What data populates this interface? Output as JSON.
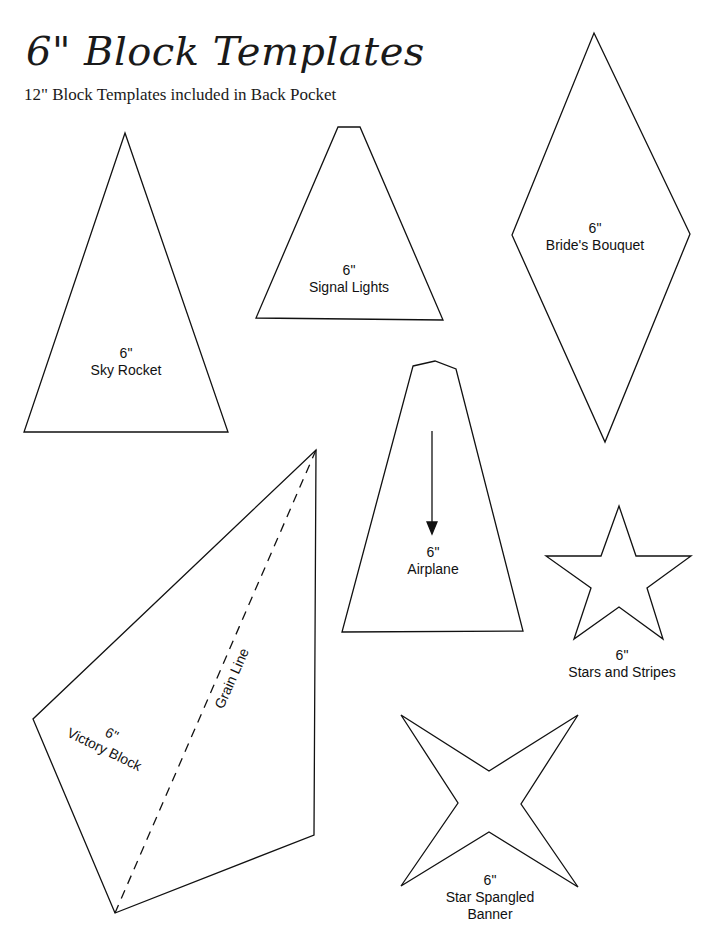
{
  "header": {
    "title": "6\" Block Templates",
    "subtitle": "12\" Block Templates included in Back Pocket"
  },
  "templates": [
    {
      "size": "6\"",
      "name": "Sky Rocket",
      "shape": "triangle"
    },
    {
      "size": "6\"",
      "name": "Signal Lights",
      "shape": "trapezoid"
    },
    {
      "size": "6\"",
      "name": "Bride's Bouquet",
      "shape": "diamond"
    },
    {
      "size": "6\"",
      "name": "Airplane",
      "shape": "pentagon-with-arrow"
    },
    {
      "size": "6\"",
      "name": "Stars and Stripes",
      "shape": "five-point-star"
    },
    {
      "size": "6\"",
      "name": "Victory Block",
      "shape": "kite",
      "grain_label": "Grain Line"
    },
    {
      "size": "6\"",
      "name": "Star Spangled",
      "name_line2": "Banner",
      "shape": "four-point-star"
    }
  ],
  "colors": {
    "stroke": "#111111",
    "background": "#ffffff"
  }
}
